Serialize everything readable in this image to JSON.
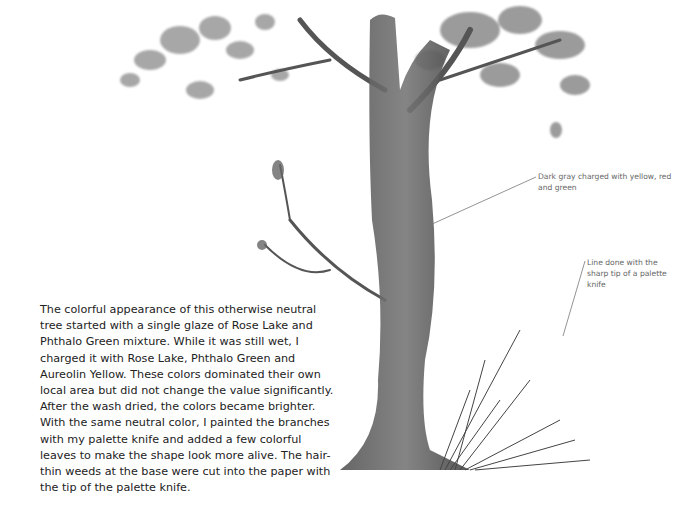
{
  "caption": {
    "text": "The colorful appearance of this otherwise neutral tree started with a single glaze of Rose Lake and Phthalo Green mixture. While it was still wet, I charged it with Rose Lake, Phthalo Green and Aureolin Yellow. These colors dominated their own local area but did not change the value significantly. After the wash dried, the colors became brighter. With the same neutral color, I painted the branches with my palette knife and added a few colorful leaves to make the shape look more alive. The hair-thin weeds at the base were cut into the paper with the tip of the palette knife."
  },
  "annotations": [
    {
      "text": "Dark gray charged with yellow, red and green"
    },
    {
      "text": "Line done with the sharp tip of a palette knife"
    }
  ],
  "image": {
    "subject": "watercolor-tree-painting"
  }
}
